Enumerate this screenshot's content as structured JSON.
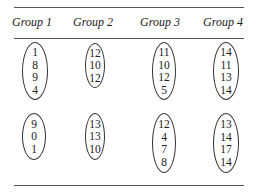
{
  "table": {
    "headers": [
      "Group 1",
      "Group 2",
      "Group 3",
      "Group 4"
    ],
    "clusters": [
      {
        "row": 1,
        "group": 1,
        "values": [
          "1",
          "8",
          "9",
          "4"
        ]
      },
      {
        "row": 1,
        "group": 2,
        "values": [
          "12",
          "10",
          "12"
        ]
      },
      {
        "row": 1,
        "group": 3,
        "values": [
          "11",
          "10",
          "12",
          "5"
        ]
      },
      {
        "row": 1,
        "group": 4,
        "values": [
          "14",
          "11",
          "13",
          "14"
        ]
      },
      {
        "row": 2,
        "group": 1,
        "values": [
          "9",
          "0",
          "1"
        ]
      },
      {
        "row": 2,
        "group": 2,
        "values": [
          "13",
          "13",
          "10"
        ]
      },
      {
        "row": 2,
        "group": 3,
        "values": [
          "12",
          "4",
          "7",
          "8"
        ]
      },
      {
        "row": 2,
        "group": 4,
        "values": [
          "13",
          "14",
          "17",
          "14"
        ]
      }
    ]
  }
}
